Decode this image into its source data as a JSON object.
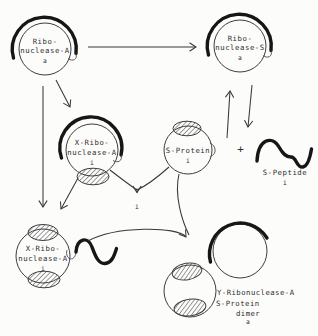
{
  "diagram": {
    "type": "reaction-scheme",
    "background": "#fcfcfb",
    "ink": "#2e2e2e",
    "heavy_ink": "#161616",
    "nodes": {
      "ribonuclease_a": {
        "line1": "Ribo-",
        "line2": "nuclease-A",
        "subscript": "a"
      },
      "ribonuclease_s": {
        "line1": "Ribo-",
        "line2": "nuclease-S",
        "subscript": "a"
      },
      "x_ribonuclease_a": {
        "line1": "X-Ribo-",
        "line2": "nuclease-A",
        "subscript": "i"
      },
      "s_protein": {
        "label": "S-Protein",
        "subscript": "i"
      },
      "s_peptide": {
        "label": "S-Peptide",
        "subscript": "i"
      },
      "x_ribonuclease_a_complex": {
        "line1": "X-Ribo-",
        "line2": "nuclease-A",
        "subscript": "i"
      },
      "y_dimer": {
        "line1": "Y-Ribonuclease-A",
        "line2": "S-Protein",
        "line3": "dimer",
        "subscript": "a"
      }
    },
    "labels": {
      "plus": "+",
      "intermediate": "i"
    }
  }
}
